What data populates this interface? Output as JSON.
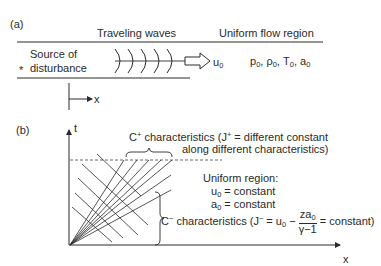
{
  "panel_a": {
    "label": "(a)",
    "traveling_waves_label": "Traveling waves",
    "uniform_flow_label": "Uniform flow region",
    "source_marker": "*",
    "source_line1": "Source of",
    "source_line2": "disturbance",
    "velocity_symbol": "u",
    "velocity_sub": "0",
    "state_variables": [
      {
        "sym": "p",
        "sub": "0"
      },
      {
        "sym": "ρ",
        "sub": "0"
      },
      {
        "sym": "T",
        "sub": "0"
      },
      {
        "sym": "a",
        "sub": "0"
      }
    ],
    "x_axis_label": "x"
  },
  "panel_b": {
    "label": "(b)",
    "t_axis_label": "t",
    "x_axis_label": "x",
    "c_plus": {
      "symbol": "C",
      "sup": "+",
      "line1_rest": " characteristics (J",
      "line1_sup": "+",
      "line1_tail": " = different constant",
      "line2": "along different characteristics)"
    },
    "uniform_region": {
      "title": "Uniform region:",
      "line1_sym": "u",
      "line1_sub": "0",
      "line1_rest": " = constant",
      "line2_sym": "a",
      "line2_sub": "0",
      "line2_rest": " = constant"
    },
    "c_minus": {
      "symbol": "C",
      "sup": "−",
      "rest": " characteristics (J",
      "j_sup": "−",
      "eq": " = u",
      "eq_sub": "0",
      "minus": " − ",
      "frac_num": "za",
      "frac_num_sub": "0",
      "frac_den": "γ−1",
      "tail": " = constant)"
    }
  }
}
